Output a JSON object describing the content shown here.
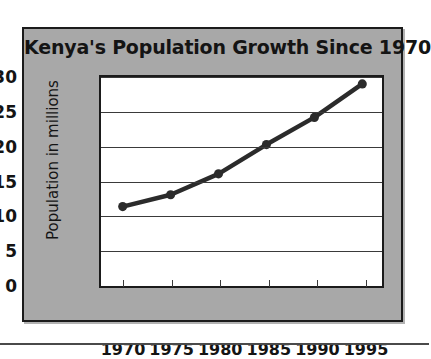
{
  "chart_data": {
    "type": "line",
    "title": "Kenya's Population Growth Since 1970",
    "xlabel": "",
    "ylabel": "Population in millions",
    "categories": [
      "1970",
      "1975",
      "1980",
      "1985",
      "1990",
      "1995"
    ],
    "x": [
      1970,
      1975,
      1980,
      1985,
      1990,
      1995
    ],
    "values": [
      11.4,
      13.1,
      16.1,
      20.3,
      24.2,
      29.0
    ],
    "series": [
      {
        "name": "Kenya population",
        "values": [
          11.4,
          13.1,
          16.1,
          20.3,
          24.2,
          29.0
        ]
      }
    ],
    "ylim": [
      0,
      30
    ],
    "ytick_labels": [
      "0",
      "5",
      "10",
      "15",
      "20",
      "25",
      "30"
    ],
    "yticks": [
      0,
      5,
      10,
      15,
      20,
      25,
      30
    ],
    "xtick_labels": [
      "1970",
      "1975",
      "1980",
      "1985",
      "1990",
      "1995"
    ],
    "grid": "horizontal",
    "legend": "none",
    "marker": "circle",
    "colors": {
      "line": "#2b2b2b",
      "marker": "#2b2b2b",
      "plot_background": "#ffffff",
      "frame_background": "#a8a8a8",
      "border": "#1b1b1b",
      "gridline": "#3a3a3a",
      "text": "#141414"
    }
  }
}
